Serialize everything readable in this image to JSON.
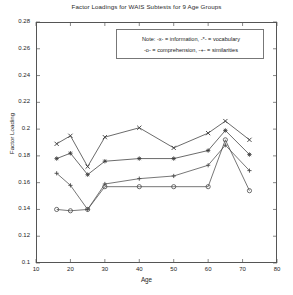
{
  "chart_data": {
    "type": "line",
    "title": "Factor Loadings for WAIS Subtests for 9 Age Groups",
    "xlabel": "Age",
    "ylabel": "Factor Loading",
    "xlim": [
      10,
      80
    ],
    "ylim": [
      0.1,
      0.28
    ],
    "xticks": [
      10,
      20,
      30,
      40,
      50,
      60,
      70,
      80
    ],
    "yticks": [
      0.1,
      0.12,
      0.14,
      0.16,
      0.18,
      0.2,
      0.22,
      0.24,
      0.26,
      0.28
    ],
    "xticklabels": [
      "10",
      "20",
      "30",
      "40",
      "50",
      "60",
      "70",
      "80"
    ],
    "yticklabels": [
      "0.1",
      "0.12",
      "0.14",
      "0.16",
      "0.18",
      "0.2",
      "0.22",
      "0.24",
      "0.26",
      "0.28"
    ],
    "grid": false,
    "legend_position": "upper-center-inside",
    "x": [
      16,
      20,
      25,
      30,
      40,
      50,
      60,
      65,
      72
    ],
    "series": [
      {
        "name": "information",
        "marker": "x",
        "color": "#3a3a3a",
        "values": [
          0.189,
          0.195,
          0.172,
          0.194,
          0.201,
          0.186,
          0.197,
          0.206,
          0.192
        ]
      },
      {
        "name": "vocabulary",
        "marker": "*",
        "color": "#3a3a3a",
        "values": [
          0.178,
          0.182,
          0.166,
          0.176,
          0.178,
          0.178,
          0.184,
          0.199,
          0.181
        ]
      },
      {
        "name": "comprehension",
        "marker": "o",
        "color": "#4a4a4a",
        "values": [
          0.14,
          0.139,
          0.14,
          0.157,
          0.157,
          0.157,
          0.157,
          0.192,
          0.154
        ]
      },
      {
        "name": "similarities",
        "marker": "+",
        "color": "#4a4a4a",
        "values": [
          0.167,
          0.158,
          0.14,
          0.159,
          0.163,
          0.165,
          0.173,
          0.188,
          0.169
        ]
      }
    ]
  },
  "legend": {
    "line1": "Note: -x- = information,  -*- = vocabulary",
    "line2": "-o- = comprehension,  -+- = similarities"
  }
}
